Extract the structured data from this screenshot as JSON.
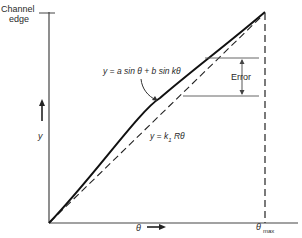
{
  "diagram": {
    "axis_label_top": {
      "line1": "Channel",
      "line2": "edge"
    },
    "y_axis_label": "y",
    "x_axis_label": "θ",
    "x_max_label": {
      "symbol": "θ",
      "subscript": "max"
    },
    "curve_label": "y = a sin θ + b sin kθ",
    "linear_label": {
      "prefix": "y = k",
      "subscript": "1",
      "suffix": " Rθ"
    },
    "error_label": "Error",
    "colors": {
      "line": "#1a1a1a",
      "axis": "#444444",
      "guide": "#555555",
      "background": "#ffffff"
    }
  }
}
